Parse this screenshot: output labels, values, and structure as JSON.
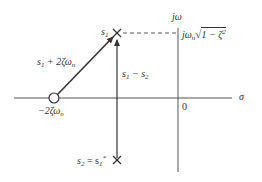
{
  "figure": {
    "type": "s-plane pole-zero diagram",
    "axes": {
      "vertical_label": "jω",
      "horizontal_label": "σ",
      "origin_label": "0"
    },
    "zero": {
      "label": "−2ζω",
      "label_sub": "n",
      "marker": "circle"
    },
    "pole_upper": {
      "label": "s",
      "label_sub": "1",
      "marker": "cross"
    },
    "pole_lower": {
      "label_lhs": "s",
      "label_lhs_sub": "2",
      "label_eq": " = s",
      "label_rhs_sub": "1",
      "label_rhs_sup": "*",
      "marker": "cross"
    },
    "imag_part": {
      "prefix": "jω",
      "prefix_sub": "n",
      "sqrt_body": "1 − ζ",
      "sqrt_sup": "2"
    },
    "vectors": [
      {
        "label": "s",
        "label_sub": "1",
        "label_tail": " + 2ζω",
        "label_tail_sub": "n",
        "from": "zero",
        "to": "s1"
      },
      {
        "label": "s",
        "label_sub": "1",
        "label_mid": " − s",
        "label_mid_sub": "2",
        "from": "s2",
        "to": "s1"
      }
    ],
    "dashed_line": "from s1 to jω axis"
  },
  "colors": {
    "ink": "#333333",
    "background": "#ffffff"
  }
}
